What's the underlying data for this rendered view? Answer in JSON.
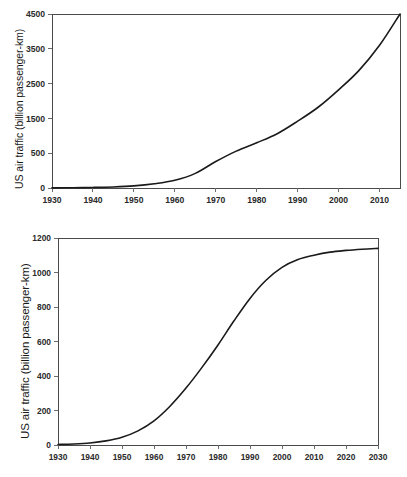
{
  "figure": {
    "panel_count": 2,
    "background": "#ffffff",
    "line_color": "#1a1a1a",
    "axis_color": "#4a4a4a"
  },
  "chart_data": [
    {
      "type": "line",
      "title": "",
      "xlabel": "",
      "ylabel": "US air traffic (billion passenger-km)",
      "xlim": [
        1930,
        2015
      ],
      "ylim": [
        0,
        4500
      ],
      "grid": false,
      "legend": "none",
      "xticks": [
        "1930",
        "1940",
        "1950",
        "1960",
        "1970",
        "1980",
        "1990",
        "2000",
        "2010"
      ],
      "xtick_values": [
        1930,
        1940,
        1950,
        1960,
        1970,
        1980,
        1990,
        2000,
        2010
      ],
      "yticks": [
        "0",
        "500",
        "1500",
        "2500",
        "3500",
        "4500"
      ],
      "ytick_values": [
        0,
        500,
        1500,
        2500,
        3500,
        4500
      ],
      "x": [
        1930,
        1935,
        1940,
        1945,
        1950,
        1955,
        1960,
        1965,
        1970,
        1975,
        1980,
        1985,
        1990,
        1995,
        2000,
        2005,
        2010,
        2015
      ],
      "values": [
        2,
        4,
        8,
        15,
        30,
        60,
        110,
        210,
        380,
        560,
        800,
        1060,
        1420,
        1820,
        2320,
        2880,
        3600,
        4500
      ]
    },
    {
      "type": "line",
      "title": "",
      "xlabel": "",
      "ylabel": "US air traffic (billion passenger-km)",
      "xlim": [
        1930,
        2030
      ],
      "ylim": [
        0,
        1200
      ],
      "grid": false,
      "legend": "none",
      "xticks": [
        "1930",
        "1940",
        "1950",
        "1960",
        "1970",
        "1980",
        "1990",
        "2000",
        "2010",
        "2020",
        "2030"
      ],
      "xtick_values": [
        1930,
        1940,
        1950,
        1960,
        1970,
        1980,
        1990,
        2000,
        2010,
        2020,
        2030
      ],
      "yticks": [
        "0",
        "200",
        "400",
        "600",
        "800",
        "1000",
        "1200"
      ],
      "ytick_values": [
        0,
        200,
        400,
        600,
        800,
        1000,
        1200
      ],
      "x": [
        1930,
        1935,
        1940,
        1945,
        1950,
        1955,
        1960,
        1965,
        1970,
        1975,
        1980,
        1985,
        1990,
        1995,
        2000,
        2005,
        2010,
        2015,
        2020,
        2025,
        2030
      ],
      "values": [
        3,
        6,
        12,
        24,
        45,
        82,
        140,
        225,
        330,
        450,
        580,
        720,
        850,
        955,
        1030,
        1075,
        1100,
        1118,
        1128,
        1135,
        1140
      ]
    }
  ]
}
